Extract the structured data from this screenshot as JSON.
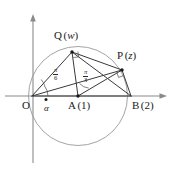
{
  "figure": {
    "background_color": "#ffffff",
    "axis_color": "#8a8a8a",
    "circle_color": "#9a9a9a",
    "chord_color": "#3a3a3a",
    "label_color": "#1a1a1a"
  },
  "points": {
    "origin": {
      "label": "O",
      "x": 32,
      "y": 96
    },
    "center": {
      "label": "A",
      "value": "(1)",
      "full": "A (1)",
      "x": 78,
      "y": 96
    },
    "right": {
      "label": "B",
      "value": "(2)",
      "full": "B (2)",
      "x": 131,
      "y": 96
    },
    "upper_left": {
      "label": "Q",
      "value": "(w)",
      "variable": "w",
      "x": 72,
      "y": 52
    },
    "upper_right": {
      "label": "P",
      "value": "(z)",
      "variable": "z",
      "x": 122,
      "y": 70
    }
  },
  "labels": {
    "origin": "O",
    "center_name": "A",
    "center_paren": "(1)",
    "right_name": "B",
    "right_paren": "(2)",
    "q_name": "Q",
    "q_open": "(",
    "q_var": "w",
    "q_close": ")",
    "p_name": "P",
    "p_open": "(",
    "p_var": "z",
    "p_close": ")",
    "alpha": "α"
  },
  "angles": [
    {
      "name": "angle-alpha-at-origin",
      "symbol": "α",
      "vertex": "O",
      "x": 47,
      "y": 103
    },
    {
      "name": "angle-pi-over-6-at-origin",
      "numerator": "π",
      "denominator": "6",
      "vertex": "O",
      "x": 55,
      "y": 70
    },
    {
      "name": "angle-pi-over-3-at-center",
      "numerator": "π",
      "denominator": "3",
      "vertex": "A",
      "x": 85,
      "y": 72
    }
  ],
  "circle": {
    "center_x": 78,
    "center_y": 96,
    "radius": 49.5
  },
  "axes": {
    "x_axis": {
      "from_x": 5,
      "to_x": 168,
      "y": 96
    },
    "y_axis": {
      "x": 33,
      "from_y": 163,
      "to_y": 15
    }
  }
}
